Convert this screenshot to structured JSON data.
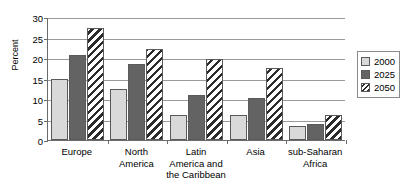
{
  "chart_data": {
    "type": "bar",
    "title": "",
    "subtitle": "",
    "xlabel": "",
    "ylabel": "Percent",
    "ylim": [
      0,
      30
    ],
    "yticks": [
      0,
      5,
      10,
      15,
      20,
      25,
      30
    ],
    "ytick_labels": [
      "0",
      "5",
      "10",
      "15",
      "20",
      "25",
      "30"
    ],
    "grid": true,
    "legend_position": "right",
    "categories": [
      "Europe",
      "North America",
      "Latin America and the Caribbean",
      "Asia",
      "sub-Saharan Africa"
    ],
    "category_label_lines": [
      [
        "Europe"
      ],
      [
        "North",
        "America"
      ],
      [
        "Latin",
        "America and",
        "the Caribbean"
      ],
      [
        "Asia"
      ],
      [
        "sub-Saharan",
        "Africa"
      ]
    ],
    "series": [
      {
        "name": "2000",
        "color": "#d9d9d9",
        "fill": "solid-light-gray",
        "values": [
          14.9,
          12.4,
          6.0,
          6.0,
          3.4
        ]
      },
      {
        "name": "2025",
        "color": "#636363",
        "fill": "solid-dark-gray",
        "values": [
          20.8,
          18.5,
          10.9,
          10.2,
          4.0
        ]
      },
      {
        "name": "2050",
        "color": "#2b2b2b",
        "fill": "diagonal-hatch",
        "values": [
          27.4,
          22.1,
          19.7,
          17.5,
          6.2
        ]
      }
    ]
  },
  "legend": {
    "items": [
      {
        "label": "2000",
        "swatch": "legend-swatch-2000"
      },
      {
        "label": "2025",
        "swatch": "legend-swatch-2025"
      },
      {
        "label": "2050",
        "swatch": "legend-swatch-2050"
      }
    ]
  },
  "axes": {
    "y_title": "Percent"
  }
}
